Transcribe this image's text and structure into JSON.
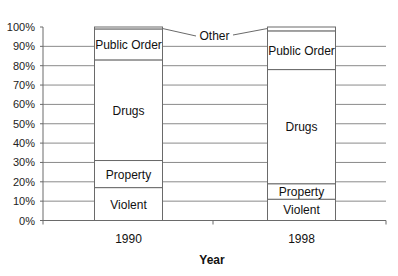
{
  "chart_data": {
    "type": "bar",
    "stacked": true,
    "percent_stacked": true,
    "title": "",
    "xlabel": "Year",
    "ylabel": "",
    "ylim": [
      0,
      100
    ],
    "yticks": [
      "0%",
      "10%",
      "20%",
      "30%",
      "40%",
      "50%",
      "60%",
      "70%",
      "80%",
      "90%",
      "100%"
    ],
    "grid": true,
    "legend": "inline segment labels",
    "categories": [
      "1990",
      "1998"
    ],
    "series": [
      {
        "name": "Violent",
        "values": [
          17,
          11
        ]
      },
      {
        "name": "Property",
        "values": [
          14,
          8
        ]
      },
      {
        "name": "Drugs",
        "values": [
          52,
          59
        ]
      },
      {
        "name": "Public Order",
        "values": [
          16,
          20
        ]
      },
      {
        "name": "Other",
        "values": [
          1,
          2
        ]
      }
    ],
    "annotations": [
      {
        "text": "Other",
        "points_to": [
          "1990 Other segment",
          "1998 Other segment"
        ]
      }
    ]
  }
}
